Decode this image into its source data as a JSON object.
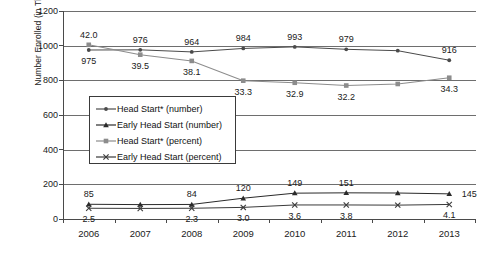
{
  "chart_data": {
    "type": "line",
    "title": "",
    "xlabel": "",
    "ylabel": "Number Enrolled (in Thousands)",
    "ylim": [
      0,
      1200
    ],
    "ytick_labels": [
      "0",
      "200",
      "400",
      "600",
      "800",
      "1000",
      "1200"
    ],
    "ytick_values": [
      0,
      200,
      400,
      600,
      800,
      1000,
      1200
    ],
    "grid": "horizontal",
    "legend_position": "center-left-inside",
    "categories": [
      "2006",
      "2007",
      "2008",
      "2009",
      "2010",
      "2011",
      "2012",
      "2013"
    ],
    "x": [
      2006,
      2007,
      2008,
      2009,
      2010,
      2011,
      2012,
      2013
    ],
    "series": [
      {
        "name": "Head Start* (number)",
        "color": "#4a4a4a",
        "marker": "dot",
        "plotted_values": [
          975,
          976,
          964,
          984,
          993,
          979,
          971,
          916
        ],
        "point_labels": [
          "975",
          "976",
          "964",
          "984",
          "993",
          "979",
          "",
          "916"
        ],
        "label_positions": [
          "below",
          "above",
          "above",
          "above",
          "above",
          "above",
          "",
          "above"
        ]
      },
      {
        "name": "Early Head Start (number)",
        "color": "#2a2a2a",
        "marker": "triangle",
        "plotted_values": [
          85,
          83,
          84,
          120,
          149,
          151,
          150,
          145
        ],
        "point_labels": [
          "85",
          "",
          "84",
          "120",
          "149",
          "151",
          "",
          "145"
        ],
        "label_positions": [
          "above",
          "",
          "above",
          "above",
          "above",
          "above",
          "",
          "right"
        ]
      },
      {
        "name": "Head Start* (percent)",
        "color": "#8c8c8c",
        "marker": "square",
        "plotted_values_as_scaled": [
          1005,
          948,
          912,
          798,
          786,
          770,
          779,
          815
        ],
        "percent_values": [
          42.0,
          39.5,
          38.1,
          33.3,
          32.9,
          32.2,
          32.6,
          34.3
        ],
        "point_labels": [
          "42.0",
          "39.5",
          "38.1",
          "33.3",
          "32.9",
          "32.2",
          "",
          "34.3"
        ],
        "label_positions": [
          "above",
          "below",
          "below",
          "below",
          "below",
          "below",
          "",
          "below"
        ]
      },
      {
        "name": "Early Head Start (percent)",
        "color": "#3a3a3a",
        "marker": "x",
        "plotted_values_as_scaled": [
          62,
          61,
          62,
          67,
          81,
          81,
          80,
          84
        ],
        "percent_values": [
          2.5,
          2.4,
          2.3,
          3.0,
          3.6,
          3.8,
          3.9,
          4.1
        ],
        "point_labels": [
          "2.5",
          "",
          "2.3",
          "3.0",
          "3.6",
          "3.8",
          "",
          "4.1"
        ],
        "label_positions": [
          "below",
          "",
          "below",
          "below",
          "below",
          "below",
          "",
          "below"
        ]
      }
    ]
  }
}
